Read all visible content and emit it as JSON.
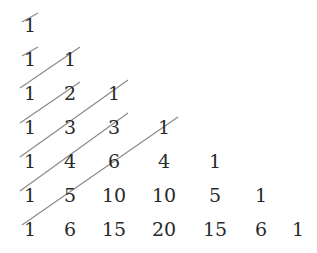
{
  "rows": [
    [
      1
    ],
    [
      1,
      1
    ],
    [
      1,
      2,
      1
    ],
    [
      1,
      3,
      3,
      1
    ],
    [
      1,
      4,
      6,
      4,
      1
    ],
    [
      1,
      5,
      10,
      10,
      5,
      1
    ],
    [
      1,
      6,
      15,
      20,
      15,
      6,
      1
    ]
  ],
  "layout": {
    "col_x": [
      30,
      70,
      114,
      164,
      215,
      261,
      298
    ],
    "row_y": [
      25,
      59,
      93,
      127,
      161,
      195,
      229
    ]
  },
  "diagonals": [
    {
      "x1": 22,
      "y1": 22,
      "x2": 38,
      "y2": 13
    },
    {
      "x1": 22,
      "y1": 56,
      "x2": 38,
      "y2": 47
    },
    {
      "x1": 20,
      "y1": 88,
      "x2": 80,
      "y2": 47
    },
    {
      "x1": 20,
      "y1": 123,
      "x2": 80,
      "y2": 82
    },
    {
      "x1": 20,
      "y1": 157,
      "x2": 128,
      "y2": 80
    },
    {
      "x1": 20,
      "y1": 191,
      "x2": 128,
      "y2": 113
    },
    {
      "x1": 22,
      "y1": 225,
      "x2": 178,
      "y2": 117
    }
  ],
  "colors": {
    "text": "#2a2a2a",
    "line": "#8a8a8a"
  }
}
